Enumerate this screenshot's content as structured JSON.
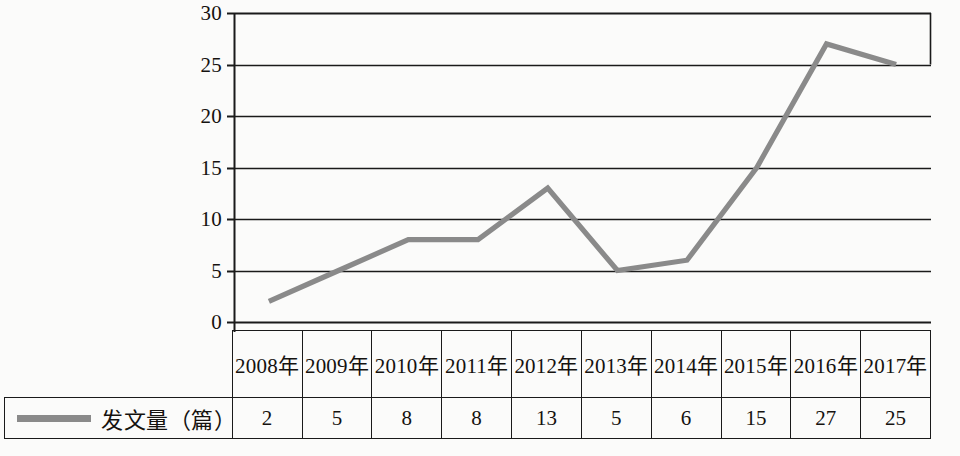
{
  "chart_data": {
    "type": "line",
    "title": "",
    "xlabel": "",
    "ylabel": "",
    "categories": [
      "2008年",
      "2009年",
      "2010年",
      "2011年",
      "2012年",
      "2013年",
      "2014年",
      "2015年",
      "2016年",
      "2017年"
    ],
    "series": [
      {
        "name": "发文量（篇）",
        "values": [
          2,
          5,
          8,
          8,
          13,
          5,
          6,
          15,
          27,
          25
        ],
        "color": "#8a8a8a"
      }
    ],
    "ylim": [
      0,
      30
    ],
    "ytick_labels": [
      "30",
      "25",
      "20",
      "15",
      "10",
      "5",
      "0"
    ],
    "ytick_values": [
      30,
      25,
      20,
      15,
      10,
      5,
      0
    ],
    "grid": true,
    "grid_axis": "y",
    "legend_position": "bottom-left",
    "markers": false
  },
  "table": {
    "legend_label": "发文量（篇）",
    "legend_swatch_color": "#8a8a8a",
    "year_headers": [
      "2008年",
      "2009年",
      "2010年",
      "2011年",
      "2012年",
      "2013年",
      "2014年",
      "2015年",
      "2016年",
      "2017年"
    ],
    "values": [
      "2",
      "5",
      "8",
      "8",
      "13",
      "5",
      "6",
      "15",
      "27",
      "25"
    ]
  },
  "axis": {
    "labels": [
      "30",
      "25",
      "20",
      "15",
      "10",
      "5",
      "0"
    ]
  }
}
